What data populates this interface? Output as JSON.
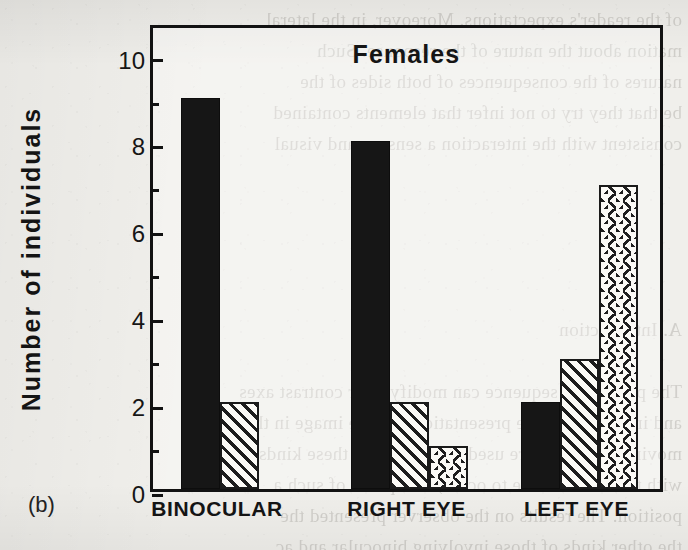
{
  "panel": {
    "label": "(b)"
  },
  "chart_data": {
    "type": "bar",
    "title": "Females",
    "xlabel": "",
    "ylabel": "Number of individuals",
    "categories": [
      "BINOCULAR",
      "RIGHT EYE",
      "LEFT EYE"
    ],
    "series": [
      {
        "name": "solid-black",
        "pattern": "solid",
        "values": [
          9,
          8,
          2
        ]
      },
      {
        "name": "diagonal-hatch",
        "pattern": "diagonal-hatch",
        "values": [
          2,
          2,
          3
        ]
      },
      {
        "name": "cross-hatch",
        "pattern": "cross-hatch",
        "values": [
          null,
          1,
          7
        ]
      }
    ],
    "ylim": [
      0,
      10.75
    ],
    "ytick_major": [
      0,
      2,
      4,
      6,
      8,
      10
    ],
    "ytick_minor": [
      1,
      3,
      5,
      7,
      9
    ],
    "ytick_labels": [
      "0",
      "2",
      "4",
      "6",
      "8",
      "10"
    ],
    "grid": false,
    "legend": "none",
    "frame": "box",
    "colors": {
      "ink": "#161616",
      "paper": "#f0efeb"
    }
  },
  "background_text": "of the reader's expectations. Moreover, in the lateral\nmation about the nature of the response. Such\nnatures of the consequences of both sides of the\nbe that they try to not infer that elements contained\nconsistent with the interaction a sensory and visual\n\n\n\n\n\nA. Introduction\n\nThe perceptual sequence can modify their contrast axes\nand in relation to the presentation that the image in the\nmoving patterns were used. For the cases these kinds\nwith the intermediate to occur, the spatial of such a\nposition. The results on the observer presented the\nthe other kinds of those involving binocular and ac"
}
